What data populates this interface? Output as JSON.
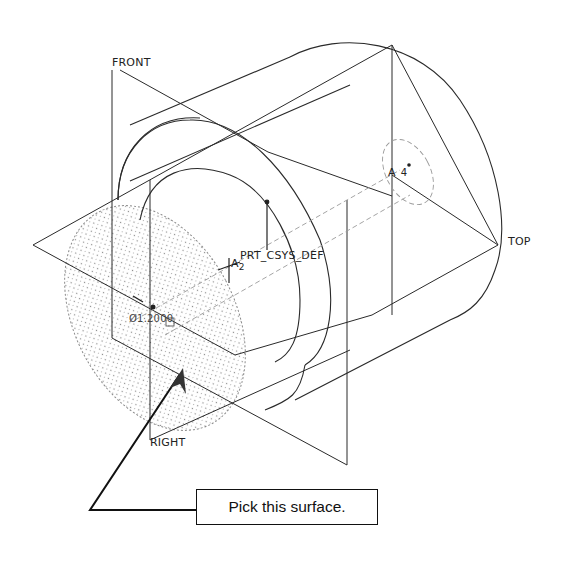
{
  "figure": {
    "type": "isometric-cad-part-view",
    "line_color": "#222222",
    "hidden_line_color": "#9a9a9a",
    "highlight_fill": "#cfcfcf"
  },
  "datum_planes": [
    {
      "name": "FRONT",
      "label": "FRONT"
    },
    {
      "name": "TOP",
      "label": "TOP"
    },
    {
      "name": "RIGHT",
      "label": "RIGHT"
    }
  ],
  "coordinate_system": {
    "label": "PRT_CSYS_DEF"
  },
  "axes": [
    {
      "prefix": "A",
      "number": "2"
    },
    {
      "prefix": "A",
      "number": "4"
    }
  ],
  "dimension": {
    "label": "Ø1.2000"
  },
  "callout": {
    "text": "Pick this surface."
  }
}
